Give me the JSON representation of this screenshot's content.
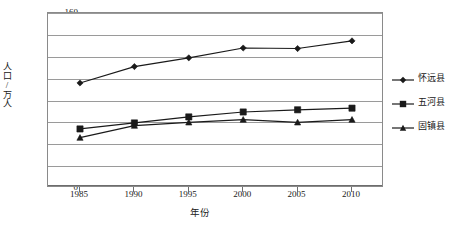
{
  "chart_data": {
    "type": "line",
    "title": "",
    "xlabel": "年份",
    "ylabel": "人口/万人",
    "categories": [
      "1985",
      "1990",
      "1995",
      "2000",
      "2005",
      "2010"
    ],
    "x": [
      1985,
      1990,
      1995,
      2000,
      2005,
      2010
    ],
    "ylim": [
      0,
      160
    ],
    "yticks": [
      "0",
      "20",
      "40",
      "60",
      "80",
      "100",
      "120",
      "140",
      "160"
    ],
    "ytick_values": [
      0,
      20,
      40,
      60,
      80,
      100,
      120,
      140,
      160
    ],
    "grid": true,
    "legend_position": "right",
    "series": [
      {
        "name": "怀远县",
        "marker": "diamond",
        "color": "#1a1a1a",
        "values": [
          96,
          111,
          119,
          128,
          127.5,
          134.5
        ]
      },
      {
        "name": "五河县",
        "marker": "square",
        "color": "#1a1a1a",
        "values": [
          54,
          59.5,
          65,
          69.5,
          71.5,
          73
        ]
      },
      {
        "name": "固镇县",
        "marker": "triangle",
        "color": "#1a1a1a",
        "values": [
          46,
          57,
          60,
          62.5,
          60,
          62.5
        ]
      }
    ]
  },
  "legend": {
    "items": [
      {
        "label": "怀远县",
        "marker": "diamond"
      },
      {
        "label": "五河县",
        "marker": "square"
      },
      {
        "label": "固镇县",
        "marker": "triangle"
      }
    ]
  },
  "colors": {
    "series": "#1a1a1a",
    "grid": "#9a9a9a",
    "frame": "#8a8a8a",
    "text": "#202020",
    "background": "#ffffff"
  }
}
